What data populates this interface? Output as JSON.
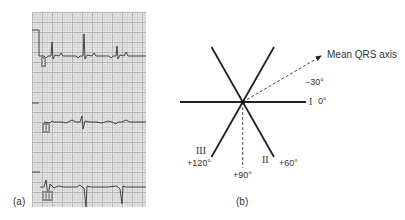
{
  "panel_a": {
    "label": "(a)",
    "leads": [
      {
        "name": "I",
        "label": "I"
      },
      {
        "name": "II",
        "label": "II"
      },
      {
        "name": "III",
        "label": "III"
      }
    ]
  },
  "panel_b": {
    "label": "(b)",
    "arrow_label": "Mean QRS axis",
    "angles": {
      "minus30": "−30°",
      "zero": "0°",
      "plus60": "+60°",
      "plus90": "+90°",
      "plus120": "+120°"
    },
    "lead_labels": {
      "I": "I",
      "II": "II",
      "III": "III"
    }
  }
}
